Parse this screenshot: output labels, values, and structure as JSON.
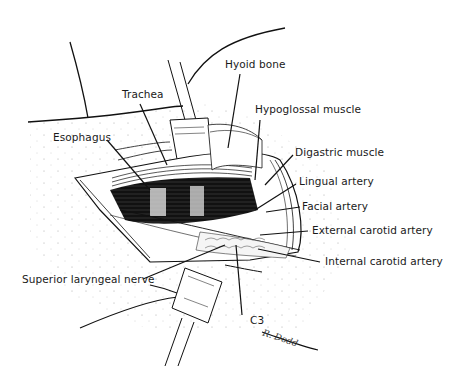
{
  "figure": {
    "type": "surgical anatomical illustration",
    "labels": [
      {
        "id": "trachea",
        "text": "Trachea"
      },
      {
        "id": "hyoid-bone",
        "text": "Hyoid bone"
      },
      {
        "id": "esophagus",
        "text": "Esophagus"
      },
      {
        "id": "hypoglossal-muscle",
        "text": "Hypoglossal muscle"
      },
      {
        "id": "digastric-muscle",
        "text": "Digastric muscle"
      },
      {
        "id": "lingual-artery",
        "text": "Lingual artery"
      },
      {
        "id": "facial-artery",
        "text": "Facial artery"
      },
      {
        "id": "external-carotid-artery",
        "text": "External carotid artery"
      },
      {
        "id": "internal-carotid-artery",
        "text": "Internal carotid artery"
      },
      {
        "id": "superior-laryngeal-nerve",
        "text": "Superior laryngeal nerve"
      },
      {
        "id": "c3",
        "text": "C3"
      }
    ],
    "signature": "R. Dodd"
  }
}
